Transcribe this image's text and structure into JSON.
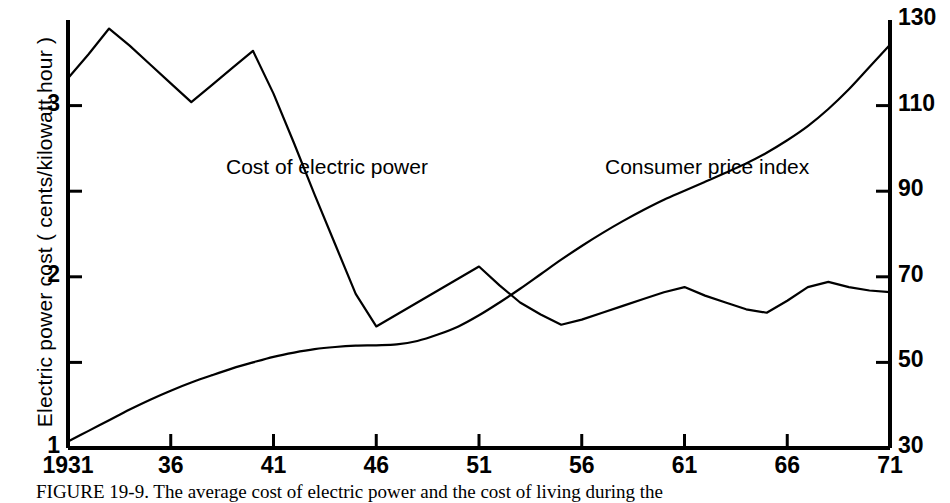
{
  "figure": {
    "caption": "FIGURE 19-9.  The average cost of electric power and the cost of living during the"
  },
  "chart_data": {
    "type": "line",
    "title": "",
    "subtitle": "",
    "xlabel": "",
    "ylabel": "Electric power cost  ( cents/kilowatt hour )",
    "y2label": "",
    "xlim": [
      1931,
      1971
    ],
    "ylim": [
      1,
      3.5
    ],
    "y2lim": [
      30,
      130
    ],
    "grid": false,
    "legend_position": "inline-annotations",
    "x_ticks": [
      {
        "value": 1931,
        "label": "1931"
      },
      {
        "value": 1936,
        "label": "36"
      },
      {
        "value": 1941,
        "label": "41"
      },
      {
        "value": 1946,
        "label": "46"
      },
      {
        "value": 1951,
        "label": "51"
      },
      {
        "value": 1956,
        "label": "56"
      },
      {
        "value": 1961,
        "label": "61"
      },
      {
        "value": 1966,
        "label": "66"
      },
      {
        "value": 1971,
        "label": "71"
      }
    ],
    "y_ticks_left": [
      {
        "value": 1,
        "label": "1"
      },
      {
        "value": 1.5,
        "label": ""
      },
      {
        "value": 2,
        "label": "2"
      },
      {
        "value": 2.5,
        "label": ""
      },
      {
        "value": 3,
        "label": "3"
      },
      {
        "value": 3.5,
        "label": ""
      }
    ],
    "y_ticks_right": [
      {
        "value": 30,
        "label": "30"
      },
      {
        "value": 50,
        "label": "50"
      },
      {
        "value": 70,
        "label": "70"
      },
      {
        "value": 90,
        "label": "90"
      },
      {
        "value": 110,
        "label": "110"
      },
      {
        "value": 130,
        "label": "130"
      }
    ],
    "series": [
      {
        "name": "Cost of electric power",
        "axis": "left",
        "color": "#000000",
        "annotation": "Cost of electric power",
        "x": [
          1931,
          1932,
          1933,
          1934,
          1935,
          1936,
          1937,
          1938,
          1939,
          1940,
          1941,
          1942,
          1943,
          1944,
          1945,
          1946,
          1947,
          1948,
          1949,
          1950,
          1951,
          1952,
          1953,
          1954,
          1955,
          1956,
          1957,
          1958,
          1959,
          1960,
          1961,
          1962,
          1963,
          1964,
          1965,
          1966,
          1967,
          1968,
          1969,
          1970,
          1971
        ],
        "values": [
          3.16,
          3.3,
          3.45,
          3.35,
          3.24,
          3.13,
          3.02,
          3.12,
          3.22,
          3.32,
          3.07,
          2.78,
          2.48,
          2.19,
          1.9,
          1.71,
          1.78,
          1.85,
          1.92,
          1.99,
          2.06,
          1.95,
          1.85,
          1.78,
          1.72,
          1.75,
          1.79,
          1.83,
          1.87,
          1.91,
          1.94,
          1.89,
          1.85,
          1.81,
          1.79,
          1.86,
          1.94,
          1.97,
          1.94,
          1.92,
          1.91
        ]
      },
      {
        "name": "Consumer price index",
        "axis": "right",
        "color": "#000000",
        "annotation": "Consumer price index",
        "x": [
          1931,
          1932,
          1933,
          1934,
          1935,
          1936,
          1937,
          1938,
          1939,
          1940,
          1941,
          1942,
          1943,
          1944,
          1945,
          1946,
          1947,
          1948,
          1949,
          1950,
          1951,
          1952,
          1953,
          1954,
          1955,
          1956,
          1957,
          1958,
          1959,
          1960,
          1961,
          1962,
          1963,
          1964,
          1965,
          1966,
          1967,
          1968,
          1969,
          1970,
          1971
        ],
        "values": [
          31.5,
          34.0,
          36.5,
          39.0,
          41.3,
          43.4,
          45.3,
          47.0,
          48.6,
          50.0,
          51.3,
          52.3,
          53.1,
          53.6,
          53.9,
          54.0,
          54.2,
          55.0,
          56.5,
          58.4,
          61.0,
          64.0,
          67.2,
          70.6,
          74.0,
          77.2,
          80.2,
          83.0,
          85.6,
          88.0,
          90.1,
          92.2,
          94.3,
          96.5,
          99.0,
          101.9,
          105.2,
          109.2,
          113.8,
          119.0,
          124.2
        ]
      }
    ]
  },
  "annotations": {
    "electric_power_label": "Cost of electric power",
    "cpi_label": "Consumer price index"
  }
}
